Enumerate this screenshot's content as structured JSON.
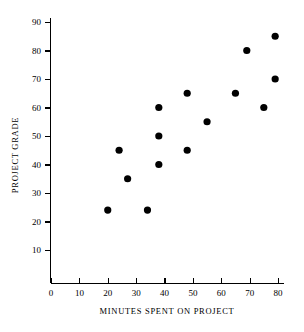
{
  "chart_data": {
    "type": "scatter",
    "title": "",
    "xlabel": "MINUTES SPENT ON PROJECT",
    "ylabel": "PROJECT GRADE",
    "xlim": [
      0,
      82
    ],
    "ylim": [
      0,
      94
    ],
    "xticks": [
      0,
      10,
      20,
      30,
      40,
      50,
      60,
      70,
      80
    ],
    "yticks": [
      10,
      20,
      30,
      40,
      50,
      60,
      70,
      80,
      90
    ],
    "grid": false,
    "legend": null,
    "marker": "filled-circle",
    "marker_color": "#000000",
    "points": [
      {
        "x": 20,
        "y": 24
      },
      {
        "x": 24,
        "y": 45
      },
      {
        "x": 27,
        "y": 35
      },
      {
        "x": 34,
        "y": 24
      },
      {
        "x": 38,
        "y": 60
      },
      {
        "x": 38,
        "y": 50
      },
      {
        "x": 38,
        "y": 40
      },
      {
        "x": 48,
        "y": 65
      },
      {
        "x": 48,
        "y": 45
      },
      {
        "x": 55,
        "y": 55
      },
      {
        "x": 65,
        "y": 65
      },
      {
        "x": 69,
        "y": 80
      },
      {
        "x": 75,
        "y": 60
      },
      {
        "x": 79,
        "y": 85
      },
      {
        "x": 79,
        "y": 70
      }
    ]
  },
  "axes": {
    "x_tick_labels": [
      "0",
      "10",
      "20",
      "30",
      "40",
      "50",
      "60",
      "70",
      "80"
    ],
    "y_tick_labels": [
      "10",
      "20",
      "30",
      "40",
      "50",
      "60",
      "70",
      "80",
      "90"
    ],
    "x_axis_title": "MINUTES SPENT ON PROJECT",
    "y_axis_title": "PROJECT GRADE"
  }
}
